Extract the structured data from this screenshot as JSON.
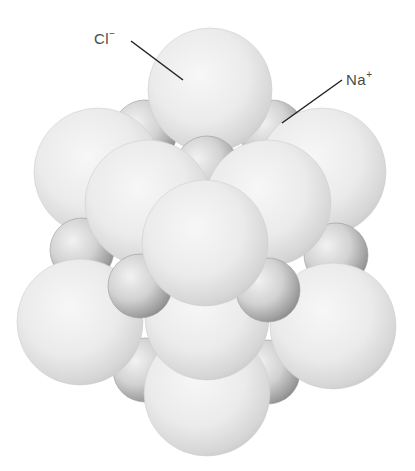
{
  "labels": {
    "chloride": {
      "symbol": "Cl",
      "charge": "−"
    },
    "sodium": {
      "symbol": "Na",
      "charge": "+"
    }
  },
  "colors": {
    "background": "#ffffff",
    "chloride_light": "#f4f4f4",
    "chloride_shade": "#bdbdbd",
    "sodium_light": "#ececec",
    "sodium_shade": "#8a8a8a",
    "leader_line": "#222222",
    "label_text": "#4a4a4a"
  },
  "ions": {
    "chloride_count_visible": 10,
    "sodium_count_visible": 9
  }
}
